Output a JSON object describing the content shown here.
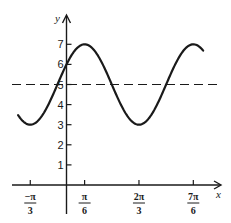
{
  "chart_data": {
    "type": "line",
    "title": "",
    "xlabel": "x",
    "ylabel": "y",
    "function": "y = 5 + 2 sin(2x + π/6)",
    "x_ticks": [
      {
        "value": -1.0472,
        "num": "−π",
        "den": "3"
      },
      {
        "value": 0.5236,
        "num": "π",
        "den": "6"
      },
      {
        "value": 2.0944,
        "num": "2π",
        "den": "3"
      },
      {
        "value": 3.6652,
        "num": "7π",
        "den": "6"
      }
    ],
    "y_ticks": [
      1,
      2,
      3,
      4,
      5,
      6,
      7
    ],
    "xlim": [
      -1.55,
      4.6
    ],
    "ylim": [
      0,
      8
    ],
    "xrange_curve": [
      -1.4,
      3.95
    ],
    "reference_line": {
      "y": 5,
      "style": "dashed"
    },
    "key_points": [
      {
        "x": -1.0472,
        "y": 3,
        "label": "minimum"
      },
      {
        "x": 0,
        "y": 6,
        "label": "y-intercept"
      },
      {
        "x": 0.5236,
        "y": 7,
        "label": "maximum"
      },
      {
        "x": 2.0944,
        "y": 3,
        "label": "minimum"
      },
      {
        "x": 3.6652,
        "y": 7,
        "label": "maximum"
      }
    ],
    "grid": false,
    "legend": null
  },
  "colors": {
    "ink": "#1a1a1a",
    "background": "#ffffff"
  }
}
